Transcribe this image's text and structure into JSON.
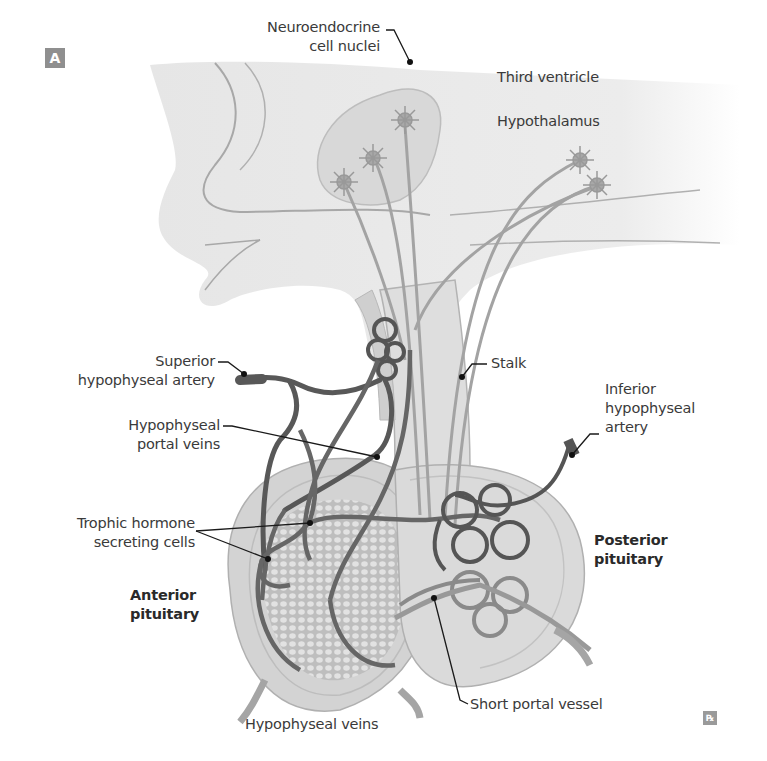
{
  "figure": {
    "panel_label": "A",
    "footer_logo": "℞",
    "colors": {
      "background": "#ffffff",
      "brain_tissue": "#e6e6e6",
      "tissue_outline": "#a8a8a8",
      "pituitary_fill": "#d4d4d4",
      "posterior_lobe_fill": "#dcdcdc",
      "artery_vessel": "#555555",
      "portal_vein": "#6e6e6e",
      "axon": "#a0a0a0",
      "neuron": "#999999",
      "leader_line": "#1a1a1a",
      "label_text": "#3a3a3a"
    }
  },
  "labels": {
    "neuroendocrine_line1": "Neuroendocrine",
    "neuroendocrine_line2": "cell nuclei",
    "third_ventricle": "Third ventricle",
    "hypothalamus": "Hypothalamus",
    "superior_artery_line1": "Superior",
    "superior_artery_line2": "hypophyseal artery",
    "stalk": "Stalk",
    "inferior_artery_line1": "Inferior",
    "inferior_artery_line2": "hypophyseal",
    "inferior_artery_line3": "artery",
    "portal_veins_line1": "Hypophyseal",
    "portal_veins_line2": "portal veins",
    "trophic_line1": "Trophic hormone",
    "trophic_line2": "secreting cells",
    "posterior_line1": "Posterior",
    "posterior_line2": "pituitary",
    "anterior_line1": "Anterior",
    "anterior_line2": "pituitary",
    "short_portal": "Short portal vessel",
    "hypophyseal_veins": "Hypophyseal veins"
  }
}
